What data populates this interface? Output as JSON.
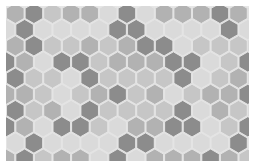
{
  "pattern": {
    "type": "hex-tile-grid",
    "orientation": "pointy-top",
    "hex_width": 18.6,
    "row_height": 16.2,
    "origin_x": 0,
    "origin_y": 2,
    "palette": {
      "0": "#dadada",
      "1": "#c6c6c6",
      "2": "#b2b2b2",
      "3": "#8c8c8c"
    },
    "stroke": "#e4e4e4",
    "rows": [
      [
        2,
        3,
        1,
        2,
        2,
        0,
        3,
        0,
        2,
        2,
        2,
        3,
        2,
        1
      ],
      [
        0,
        3,
        0,
        0,
        0,
        0,
        3,
        3,
        0,
        0,
        0,
        0,
        3,
        0
      ],
      [
        2,
        3,
        1,
        1,
        2,
        1,
        2,
        3,
        3,
        0,
        1,
        1,
        1,
        3
      ],
      [
        3,
        2,
        0,
        3,
        3,
        1,
        2,
        2,
        2,
        3,
        3,
        0,
        1,
        3
      ],
      [
        3,
        1,
        1,
        0,
        3,
        1,
        1,
        1,
        1,
        3,
        0,
        1,
        2,
        3
      ],
      [
        2,
        2,
        1,
        0,
        1,
        2,
        3,
        1,
        2,
        0,
        1,
        2,
        2,
        3
      ],
      [
        3,
        1,
        2,
        0,
        3,
        1,
        1,
        1,
        1,
        3,
        0,
        2,
        1,
        3
      ],
      [
        3,
        2,
        0,
        3,
        3,
        1,
        0,
        2,
        2,
        3,
        3,
        0,
        1,
        3
      ],
      [
        0,
        3,
        0,
        0,
        0,
        0,
        3,
        3,
        0,
        0,
        0,
        0,
        3,
        0
      ],
      [
        2,
        3,
        1,
        2,
        2,
        0,
        3,
        0,
        2,
        2,
        2,
        3,
        2,
        1
      ],
      [
        1,
        2,
        1,
        1,
        1,
        0,
        1,
        1,
        1,
        1,
        1,
        1,
        1,
        1
      ]
    ]
  }
}
